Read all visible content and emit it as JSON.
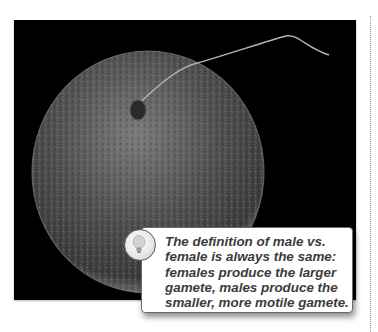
{
  "figure": {
    "image_subject": "sperm-and-egg-micrograph",
    "background_color": "#000000"
  },
  "callout": {
    "icon": "lightbulb-icon",
    "lines": [
      "The definition of male vs.",
      "female is always the same:",
      "females produce the larger",
      "gamete, males produce the",
      "smaller, more motile gamete."
    ],
    "text_color": "#3b3b3b"
  }
}
